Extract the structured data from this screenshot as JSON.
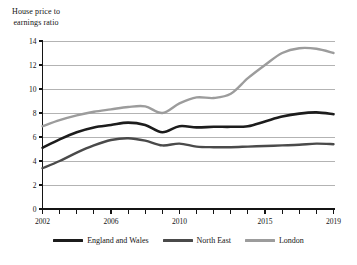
{
  "chart_data": {
    "type": "line",
    "title": "",
    "ylabel": "House price to\nearnings ratio",
    "xlabel": "",
    "ylim": [
      0,
      14
    ],
    "xlim": [
      2002,
      2019
    ],
    "grid": true,
    "legend_position": "bottom",
    "y_ticks": [
      "0",
      "2",
      "4",
      "6",
      "8",
      "10",
      "12",
      "14"
    ],
    "y_tick_values": [
      0,
      2,
      4,
      6,
      8,
      10,
      12,
      14
    ],
    "x_tick_values": [
      2002,
      2003,
      2004,
      2005,
      2006,
      2007,
      2008,
      2009,
      2010,
      2011,
      2012,
      2013,
      2014,
      2015,
      2016,
      2017,
      2018,
      2019
    ],
    "x_tick_labels": [
      {
        "value": 2002,
        "label": "2002"
      },
      {
        "value": 2006,
        "label": "2006"
      },
      {
        "value": 2010,
        "label": "2010"
      },
      {
        "value": 2015,
        "label": "2015"
      },
      {
        "value": 2019,
        "label": "2019"
      }
    ],
    "x": [
      2002,
      2003,
      2004,
      2005,
      2006,
      2007,
      2008,
      2009,
      2010,
      2011,
      2012,
      2013,
      2014,
      2015,
      2016,
      2017,
      2018,
      2019
    ],
    "series": [
      {
        "name": "England and Wales",
        "color": "#1c1c1c",
        "width": 2.6,
        "values": [
          5.1,
          5.8,
          6.4,
          6.8,
          7.0,
          7.2,
          7.0,
          6.4,
          6.9,
          6.8,
          6.85,
          6.85,
          6.9,
          7.3,
          7.7,
          7.95,
          8.05,
          7.9
        ]
      },
      {
        "name": "North East",
        "color": "#4a4a4a",
        "width": 2.4,
        "values": [
          3.4,
          4.0,
          4.7,
          5.3,
          5.75,
          5.9,
          5.7,
          5.3,
          5.45,
          5.2,
          5.15,
          5.15,
          5.2,
          5.25,
          5.3,
          5.35,
          5.45,
          5.4
        ]
      },
      {
        "name": "London",
        "color": "#9c9c9c",
        "width": 2.4,
        "values": [
          6.9,
          7.4,
          7.8,
          8.1,
          8.3,
          8.5,
          8.55,
          8.0,
          8.8,
          9.3,
          9.25,
          9.6,
          10.9,
          12.0,
          13.0,
          13.4,
          13.35,
          13.0
        ]
      }
    ]
  },
  "legend": {
    "items": [
      {
        "label": "England and Wales",
        "color": "#1c1c1c"
      },
      {
        "label": "North East",
        "color": "#4a4a4a"
      },
      {
        "label": "London",
        "color": "#9c9c9c"
      }
    ]
  },
  "colors": {
    "axis": "#141414",
    "grid": "#808080",
    "background": "#ffffff"
  }
}
